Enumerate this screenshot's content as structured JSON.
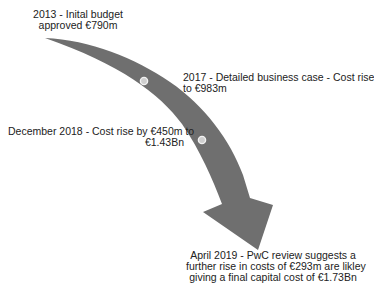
{
  "diagram": {
    "type": "timeline-arrow",
    "colors": {
      "arrow": "#6f6f6f",
      "marker_fill": "#cfcfcf",
      "marker_stroke": "#f2f2f2",
      "text": "#222222",
      "background": "#ffffff"
    },
    "milestones": [
      {
        "id": "2013",
        "lines": [
          "2013 - Inital budget",
          "approved €790m"
        ]
      },
      {
        "id": "2017",
        "lines": [
          "2017 - Detailed business case - Cost rise",
          "to €983m"
        ]
      },
      {
        "id": "2018",
        "lines": [
          "December 2018 - Cost rise by €450m to",
          "€1.43Bn"
        ]
      },
      {
        "id": "2019",
        "lines": [
          "April 2019 - PwC review suggests a",
          "further rise in costs of €293m are likley",
          "giving a final capital cost of €1.73Bn"
        ]
      }
    ],
    "markers": [
      "marker-2017",
      "marker-2018"
    ]
  }
}
